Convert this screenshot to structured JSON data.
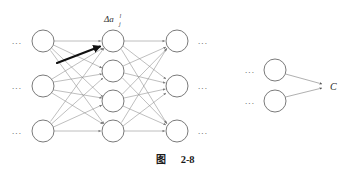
{
  "figure": {
    "caption_prefix": "图",
    "caption_number": "2-8",
    "caption_full": "图  2-8"
  },
  "labels": {
    "delta_activation": {
      "symbol": "Δa",
      "superscript": "l",
      "subscript": "j",
      "full": "Δa_j^l"
    },
    "cost": "C"
  },
  "ellipsis": {
    "glyph": "⋯",
    "dots": "..."
  },
  "colors": {
    "background": "#ffffff",
    "node_stroke": "#6b6b6b",
    "node_fill": "#ffffff",
    "edge": "#8a8a8a",
    "highlight_arrow": "#111111",
    "text": "#1f1f1f"
  },
  "network": {
    "description": "Three-layer feedforward network fragment with a highlighted perturbation arrow into the top hidden node",
    "layers": [
      {
        "name": "left-layer",
        "node_count": 3,
        "x": 43,
        "radius": 11,
        "nodes_y": [
          41,
          86,
          131
        ],
        "ellipsis_side": "left",
        "ellipsis_x": 17
      },
      {
        "name": "middle-layer",
        "node_count": 4,
        "x": 113,
        "radius": 11,
        "nodes_y": [
          41,
          71,
          101,
          131
        ],
        "ellipsis_side": "none",
        "ellipsis_x": null
      },
      {
        "name": "right-layer",
        "node_count": 3,
        "x": 177,
        "radius": 11,
        "nodes_y": [
          41,
          86,
          131
        ],
        "ellipsis_side": "right",
        "ellipsis_x": 203
      }
    ],
    "highlight_arrow": {
      "from_x": 57,
      "from_y": 63,
      "to_x": 101,
      "to_y": 46,
      "target_node": "middle-layer-node-1"
    }
  },
  "cost_diagram": {
    "description": "Two nodes converging with arrows onto the cost C",
    "nodes": [
      {
        "name": "cost-input-node-1",
        "x": 275,
        "y": 70,
        "radius": 11,
        "ellipsis_x": 250
      },
      {
        "name": "cost-input-node-2",
        "x": 275,
        "y": 101,
        "radius": 11,
        "ellipsis_x": 250
      }
    ],
    "target": {
      "x": 325,
      "y": 86,
      "label": "C",
      "label_x": 331,
      "label_y": 90
    }
  }
}
